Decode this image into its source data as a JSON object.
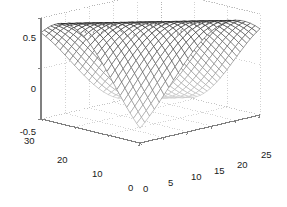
{
  "figure": {
    "type": "matlab-3d-mesh-plot",
    "background_color": "#ffffff",
    "mesh_line_color_dark": "#222222",
    "mesh_line_color_light": "#c9c9c9",
    "grid_color": "#bdbdbd",
    "axis_color": "#808080",
    "tick_text_color": "#1a1a1a"
  },
  "axes": {
    "z": {
      "label": "",
      "ticks": [
        "0.5",
        "0",
        "-0.5"
      ],
      "tick_values": [
        0.5,
        0,
        -0.5
      ],
      "lim": [
        -0.5,
        0.5
      ]
    },
    "y": {
      "label": "",
      "ticks": [
        "30",
        "20",
        "10",
        "0"
      ],
      "tick_values": [
        30,
        20,
        10,
        0
      ],
      "lim": [
        0,
        30
      ]
    },
    "x": {
      "label": "",
      "ticks": [
        "0",
        "5",
        "10",
        "15",
        "20",
        "25"
      ],
      "tick_values": [
        0,
        5,
        10,
        15,
        20,
        25
      ],
      "lim": [
        0,
        25
      ]
    }
  },
  "chart_data": {
    "type": "surface",
    "title": "",
    "xlabel": "",
    "ylabel": "",
    "zlabel": "",
    "xlim": [
      0,
      25
    ],
    "ylim": [
      0,
      30
    ],
    "zlim": [
      -0.5,
      0.5
    ],
    "xticks": [
      0,
      5,
      10,
      15,
      20,
      25
    ],
    "yticks": [
      0,
      30,
      20,
      10,
      0
    ],
    "zticks": [
      -0.5,
      0,
      0.5
    ],
    "grid": true,
    "legend": "none",
    "nx": 25,
    "ny": 30,
    "surface_expression": "z = 0.5*sin(pi*(x/25 + y/30 - 0.25))",
    "z_min": -0.5,
    "z_max": 0.5,
    "view_azimuth": -37.5,
    "view_elevation": 30
  },
  "z_ticks": {
    "t0": "0.5",
    "t1": "0",
    "t2": "-0.5"
  },
  "y_ticks": {
    "t0": "30",
    "t1": "20",
    "t2": "10",
    "t3": "0"
  },
  "x_ticks": {
    "t0": "0",
    "t1": "5",
    "t2": "10",
    "t3": "15",
    "t4": "20",
    "t5": "25"
  }
}
